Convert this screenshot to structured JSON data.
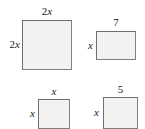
{
  "figure": {
    "fill_color": "#f2f2f0",
    "border_color": "#6f6f6f",
    "text_color": "#1a1a1a"
  },
  "shapes": [
    {
      "id": "big-square",
      "name": "large-square",
      "top_label": "2x",
      "top_label_coefficient": "2",
      "top_label_variable": "x",
      "left_label": "2x",
      "left_label_coefficient": "2",
      "left_label_variable": "x"
    },
    {
      "id": "wide-rectangle",
      "name": "wide-rectangle",
      "top_label": "7",
      "left_label": "x",
      "left_label_variable": "x"
    },
    {
      "id": "small-square",
      "name": "small-square",
      "top_label": "x",
      "top_label_variable": "x",
      "left_label": "x",
      "left_label_variable": "x"
    },
    {
      "id": "five-square",
      "name": "five-square",
      "top_label": "5",
      "left_label": "x",
      "left_label_variable": "x"
    }
  ]
}
